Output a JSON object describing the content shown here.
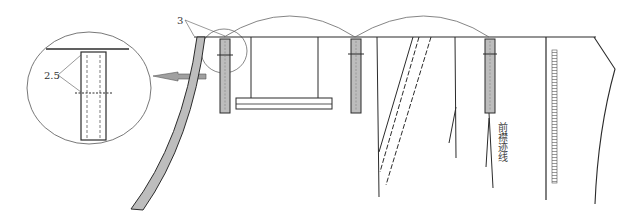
{
  "diagram": {
    "type": "garment pattern construction diagram",
    "labels": {
      "seam_allowance_top": "3",
      "detail_dimension": "2.5",
      "front_placket_trace": "前襟迹线"
    },
    "colors": {
      "line": "#2b2b2b",
      "fill_strip": "#bdbdbd",
      "thin_line": "#666666",
      "arrow_fill": "#a0a0a0"
    }
  }
}
